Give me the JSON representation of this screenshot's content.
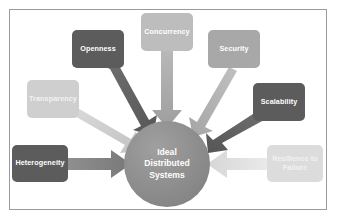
{
  "figure": {
    "top_cut_text": "",
    "background_color": "#ffffff",
    "frame_color": "#9a9a9a"
  },
  "center": {
    "label": "Ideal Distributed Systems",
    "line1": "Ideal",
    "line2": "Distributed",
    "line3": "Systems",
    "color": "#8f8f8f"
  },
  "nodes": [
    {
      "id": "openness",
      "label": "Openness",
      "color": "#5c5c5c",
      "shade": "dark",
      "x": 72,
      "y": 30,
      "w": 52,
      "h": 38
    },
    {
      "id": "concurrency",
      "label": "Concurrency",
      "color": "#bdbdbd",
      "shade": "light",
      "x": 141,
      "y": 13,
      "w": 52,
      "h": 38
    },
    {
      "id": "security",
      "label": "Security",
      "color": "#a8a8a8",
      "shade": "mid",
      "x": 208,
      "y": 30,
      "w": 52,
      "h": 38
    },
    {
      "id": "transparency",
      "label": "Transparency",
      "color": "#cfcfcf",
      "shade": "pale",
      "x": 27,
      "y": 80,
      "w": 52,
      "h": 38
    },
    {
      "id": "scalability",
      "label": "Scalability",
      "color": "#5c5c5c",
      "shade": "dark",
      "x": 253,
      "y": 83,
      "w": 52,
      "h": 38
    },
    {
      "id": "heterogeneity",
      "label": "Heterogeneity",
      "color": "#5c5c5c",
      "shade": "dark",
      "x": 12,
      "y": 145,
      "w": 56,
      "h": 37
    },
    {
      "id": "resilience-to-failure",
      "label": "Resilience to Failure",
      "line1": "Resilience to",
      "line2": "Failure",
      "color": "#dcdcdc",
      "shade": "pale",
      "x": 267,
      "y": 145,
      "w": 56,
      "h": 37
    }
  ],
  "arrows": [
    {
      "id": "arrow-openness-to-center",
      "from": "openness",
      "color": "#6e6e6e"
    },
    {
      "id": "arrow-concurrency-to-center",
      "from": "concurrency",
      "color": "#a8a8a8"
    },
    {
      "id": "arrow-security-to-center",
      "from": "security",
      "color": "#b5b5b5"
    },
    {
      "id": "arrow-transparency-to-center",
      "from": "transparency",
      "color": "#d2d2d2"
    },
    {
      "id": "arrow-scalability-to-center",
      "from": "scalability",
      "color": "#6e6e6e"
    },
    {
      "id": "arrow-heterogeneity-to-center",
      "from": "heterogeneity",
      "color": "#8a8a8a"
    },
    {
      "id": "arrow-resilience-to-center",
      "from": "resilience-to-failure",
      "color": "#e2e2e2"
    }
  ]
}
